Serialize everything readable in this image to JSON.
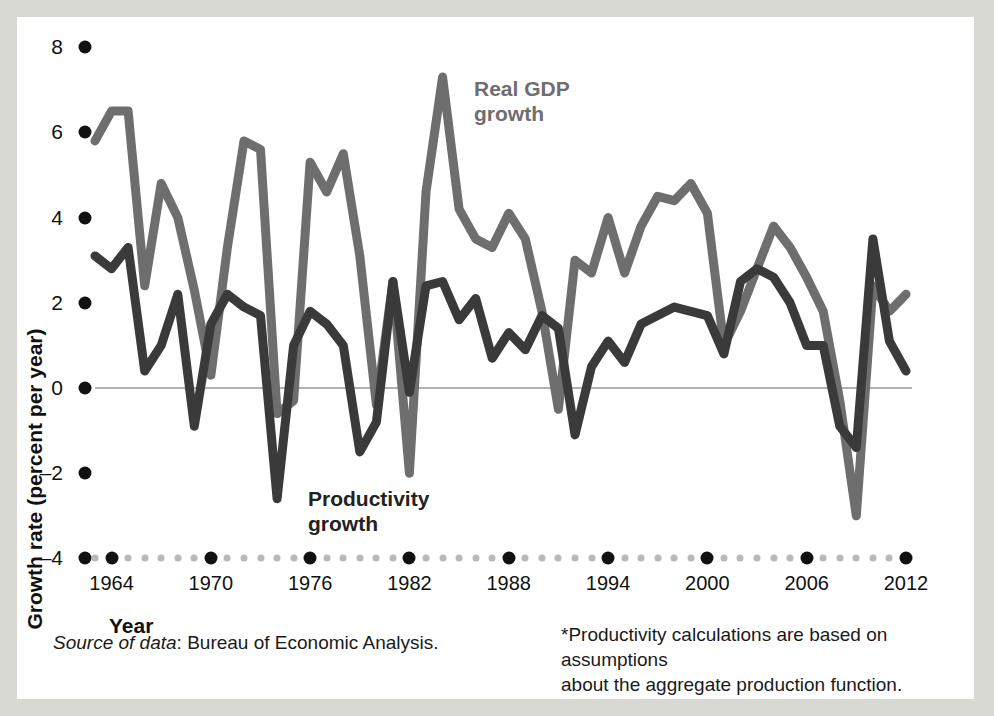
{
  "figure": {
    "background_color": "#ffffff",
    "page_border_color": "#d9d9d4",
    "zero_line_color": "#b0b0b0"
  },
  "axes": {
    "y": {
      "label": "Growth rate (percent per year)",
      "ticks": [
        "8",
        "6",
        "4",
        "2",
        "0",
        "–2",
        "–4"
      ],
      "tick_values": [
        8,
        6,
        4,
        2,
        0,
        -2,
        -4
      ],
      "range": [
        -4,
        8
      ]
    },
    "x": {
      "label": "Year",
      "ticks": [
        "1964",
        "1970",
        "1976",
        "1982",
        "1988",
        "1994",
        "2000",
        "2006",
        "2012"
      ],
      "tick_values": [
        1964,
        1970,
        1976,
        1982,
        1988,
        1994,
        2000,
        2006,
        2012
      ],
      "range": [
        1963,
        2012
      ]
    }
  },
  "annotations": {
    "gdp": "Real GDP\ngrowth",
    "gdp_line1": "Real GDP",
    "gdp_line2": "growth",
    "productivity_line1": "Productivity",
    "productivity_line2": "growth"
  },
  "notes": {
    "source_italic": "Source of data",
    "source_rest": ": Bureau of Economic Analysis.",
    "footnote_line1": "*Productivity calculations are based on assumptions",
    "footnote_line2": "about the aggregate production function."
  },
  "chart_data": {
    "type": "line",
    "title": "",
    "xlabel": "Year",
    "ylabel": "Growth rate (percent per year)",
    "xlim": [
      1963,
      2012
    ],
    "ylim": [
      -4,
      8
    ],
    "grid": false,
    "legend": "inline-annotations",
    "zero_line": 0,
    "x": [
      1963,
      1964,
      1965,
      1966,
      1967,
      1968,
      1969,
      1970,
      1971,
      1972,
      1973,
      1974,
      1975,
      1976,
      1977,
      1978,
      1979,
      1980,
      1981,
      1982,
      1983,
      1984,
      1985,
      1986,
      1987,
      1988,
      1989,
      1990,
      1991,
      1992,
      1993,
      1994,
      1995,
      1996,
      1997,
      1998,
      1999,
      2000,
      2001,
      2002,
      2003,
      2004,
      2005,
      2006,
      2007,
      2008,
      2009,
      2010,
      2011,
      2012
    ],
    "series": [
      {
        "name": "Real GDP growth",
        "color": "#6e6e6e",
        "values": [
          5.8,
          6.5,
          6.5,
          2.4,
          4.8,
          4.0,
          2.3,
          0.3,
          3.3,
          5.8,
          5.6,
          -0.6,
          -0.3,
          5.3,
          4.6,
          5.5,
          3.1,
          -0.4,
          2.5,
          -2.0,
          4.6,
          7.3,
          4.2,
          3.5,
          3.3,
          4.1,
          3.5,
          1.8,
          -0.5,
          3.0,
          2.7,
          4.0,
          2.7,
          3.8,
          4.5,
          4.4,
          4.8,
          4.1,
          1.0,
          1.8,
          2.8,
          3.8,
          3.3,
          2.6,
          1.8,
          -0.3,
          -3.0,
          2.4,
          1.8,
          2.2
        ]
      },
      {
        "name": "Productivity growth",
        "color": "#3a3a3a",
        "values": [
          3.1,
          2.8,
          3.3,
          0.4,
          1.0,
          2.2,
          -0.9,
          1.5,
          2.2,
          1.9,
          1.7,
          -2.6,
          1.0,
          1.8,
          1.5,
          1.0,
          -1.5,
          -0.8,
          2.5,
          -0.1,
          2.4,
          2.5,
          1.6,
          2.1,
          0.7,
          1.3,
          0.9,
          1.7,
          1.4,
          -1.1,
          0.5,
          1.1,
          0.6,
          1.5,
          1.7,
          1.9,
          1.8,
          1.7,
          0.8,
          2.5,
          2.8,
          2.6,
          2.0,
          1.0,
          1.0,
          -0.9,
          -1.4,
          3.5,
          1.1,
          0.4
        ]
      }
    ]
  }
}
